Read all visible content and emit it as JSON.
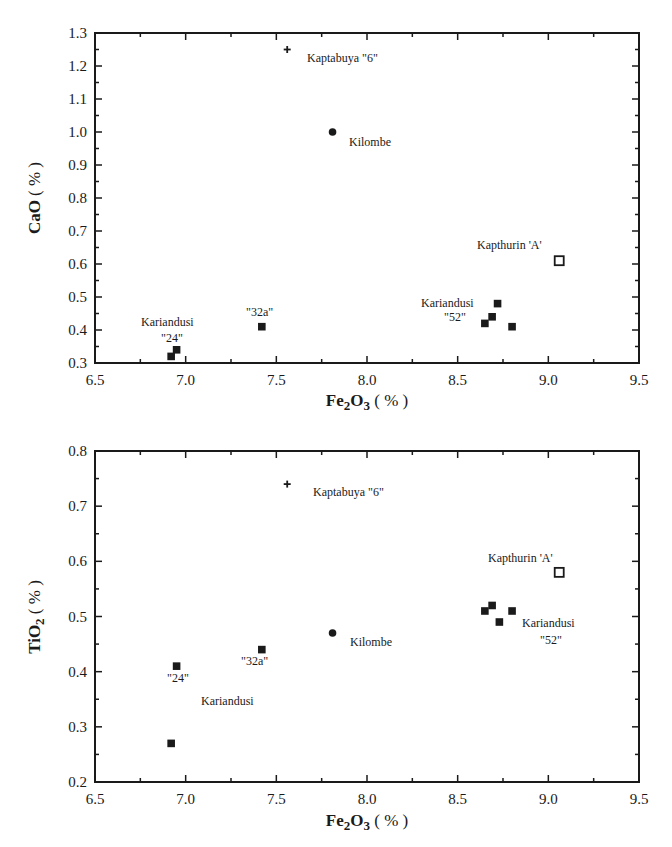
{
  "chart_data": [
    {
      "type": "scatter",
      "title": "",
      "xlabel": "Fe2O3 (%)",
      "ylabel": "CaO (%)",
      "xlim": [
        6.5,
        9.5
      ],
      "ylim": [
        0.3,
        1.3
      ],
      "xticks": [
        "6.5",
        "7.0",
        "7.5",
        "8.0",
        "8.5",
        "9.0",
        "9.5"
      ],
      "yticks": [
        "0.3",
        "0.4",
        "0.5",
        "0.6",
        "0.7",
        "0.8",
        "0.9",
        "1.0",
        "1.1",
        "1.2",
        "1.3"
      ],
      "grid": false,
      "legend": "none (points annotated directly)",
      "series": [
        {
          "name": "Kaptabuya \"6\"",
          "marker": "plus",
          "points": [
            {
              "x": 7.56,
              "y": 1.25
            }
          ]
        },
        {
          "name": "Kilombe",
          "marker": "filled-circle",
          "points": [
            {
              "x": 7.81,
              "y": 1.0
            }
          ]
        },
        {
          "name": "Kapthurin 'A'",
          "marker": "open-square",
          "points": [
            {
              "x": 9.06,
              "y": 0.61
            }
          ]
        },
        {
          "name": "Kariandusi \"24\"",
          "marker": "filled-square",
          "points": [
            {
              "x": 6.92,
              "y": 0.32
            },
            {
              "x": 6.95,
              "y": 0.34
            }
          ]
        },
        {
          "name": "Kariandusi \"32a\"",
          "marker": "filled-square",
          "points": [
            {
              "x": 7.42,
              "y": 0.41
            }
          ]
        },
        {
          "name": "Kariandusi \"52\"",
          "marker": "filled-square",
          "points": [
            {
              "x": 8.72,
              "y": 0.48
            },
            {
              "x": 8.69,
              "y": 0.44
            },
            {
              "x": 8.65,
              "y": 0.42
            },
            {
              "x": 8.8,
              "y": 0.41
            }
          ]
        }
      ],
      "annotations": [
        "Kaptabuya \"6\"",
        "Kilombe",
        "Kapthurin 'A'",
        "Kariandusi",
        "\"24\"",
        "\"32a\"",
        "Kariandusi",
        "\"52\""
      ]
    },
    {
      "type": "scatter",
      "title": "",
      "xlabel": "Fe2O3 (%)",
      "ylabel": "TiO2 (%)",
      "xlim": [
        6.5,
        9.5
      ],
      "ylim": [
        0.2,
        0.8
      ],
      "xticks": [
        "6.5",
        "7.0",
        "7.5",
        "8.0",
        "8.5",
        "9.0",
        "9.5"
      ],
      "yticks": [
        "0.2",
        "0.3",
        "0.4",
        "0.5",
        "0.6",
        "0.7",
        "0.8"
      ],
      "grid": false,
      "legend": "none (points annotated directly)",
      "series": [
        {
          "name": "Kaptabuya \"6\"",
          "marker": "plus",
          "points": [
            {
              "x": 7.56,
              "y": 0.74
            }
          ]
        },
        {
          "name": "Kilombe",
          "marker": "filled-circle",
          "points": [
            {
              "x": 7.81,
              "y": 0.47
            }
          ]
        },
        {
          "name": "Kapthurin 'A'",
          "marker": "open-square",
          "points": [
            {
              "x": 9.06,
              "y": 0.58
            }
          ]
        },
        {
          "name": "Kariandusi \"24\"",
          "marker": "filled-square",
          "points": [
            {
              "x": 6.95,
              "y": 0.41
            },
            {
              "x": 6.92,
              "y": 0.27
            }
          ]
        },
        {
          "name": "Kariandusi \"32a\"",
          "marker": "filled-square",
          "points": [
            {
              "x": 7.42,
              "y": 0.44
            }
          ]
        },
        {
          "name": "Kariandusi \"52\"",
          "marker": "filled-square",
          "points": [
            {
              "x": 8.69,
              "y": 0.52
            },
            {
              "x": 8.65,
              "y": 0.51
            },
            {
              "x": 8.8,
              "y": 0.51
            },
            {
              "x": 8.73,
              "y": 0.49
            }
          ]
        }
      ],
      "annotations": [
        "Kaptabuya \"6\"",
        "Kilombe",
        "Kapthurin 'A'",
        "\"24\"",
        "\"32a\"",
        "Kariandusi",
        "Kariandusi",
        "\"52\""
      ]
    }
  ],
  "top": {
    "ylabel_main": "CaO",
    "ylabel_unit": "( % )",
    "xlabel_fe": "Fe",
    "xlabel_sub1": "2",
    "xlabel_o": "O",
    "xlabel_sub2": "3",
    "xlabel_unit": " ( % )",
    "labels": {
      "kaptabuya": "Kaptabuya \"6\"",
      "kilombe": "Kilombe",
      "kapthurin": "Kapthurin 'A'",
      "kariandusi_24": "Kariandusi",
      "q24": "\"24\"",
      "q32a": "\"32a\"",
      "kariandusi_52": "Kariandusi",
      "q52": "\"52\""
    }
  },
  "bottom": {
    "ylabel_main": "TiO",
    "ylabel_sub": "2",
    "ylabel_unit": " ( % )",
    "xlabel_fe": "Fe",
    "xlabel_sub1": "2",
    "xlabel_o": "O",
    "xlabel_sub2": "3",
    "xlabel_unit": " ( % )",
    "labels": {
      "kaptabuya": "Kaptabuya \"6\"",
      "kilombe": "Kilombe",
      "kapthurin": "Kapthurin 'A'",
      "q24": "\"24\"",
      "q32a": "\"32a\"",
      "kariandusi_mid": "Kariandusi",
      "kariandusi_52": "Kariandusi",
      "q52": "\"52\""
    }
  },
  "colors": {
    "ink": "#1a1a1a",
    "background": "#ffffff"
  }
}
